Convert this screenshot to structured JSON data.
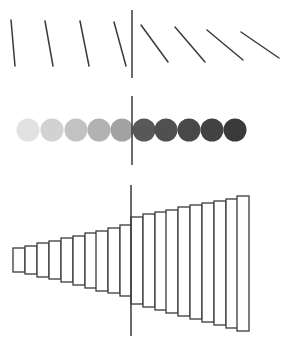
{
  "figure": {
    "width": 286,
    "height": 348,
    "background": "#ffffff",
    "stroke_color": "#3a3a3a",
    "panels": [
      {
        "name": "orientation-lines",
        "divider": {
          "x": 132,
          "y1": 10,
          "y2": 78
        },
        "lines": [
          {
            "x1": 11,
            "y1": 20,
            "x2": 15,
            "y2": 66
          },
          {
            "x1": 45,
            "y1": 21,
            "x2": 53,
            "y2": 66
          },
          {
            "x1": 80,
            "y1": 21,
            "x2": 89,
            "y2": 66
          },
          {
            "x1": 114,
            "y1": 22,
            "x2": 126,
            "y2": 66
          },
          {
            "x1": 141,
            "y1": 25,
            "x2": 168,
            "y2": 62
          },
          {
            "x1": 175,
            "y1": 27,
            "x2": 205,
            "y2": 62
          },
          {
            "x1": 207,
            "y1": 30,
            "x2": 243,
            "y2": 60
          },
          {
            "x1": 241,
            "y1": 32,
            "x2": 279,
            "y2": 58
          }
        ]
      },
      {
        "name": "gray-circles",
        "divider": {
          "x": 132,
          "y1": 96,
          "y2": 165
        },
        "cy": 130,
        "r": 11.5,
        "circles": [
          {
            "cx": 28,
            "fill": "#e2e2e2"
          },
          {
            "cx": 52,
            "fill": "#d2d2d2"
          },
          {
            "cx": 76,
            "fill": "#c2c2c2"
          },
          {
            "cx": 99,
            "fill": "#b2b2b2"
          },
          {
            "cx": 122,
            "fill": "#a2a2a2"
          },
          {
            "cx": 144,
            "fill": "#585858"
          },
          {
            "cx": 166,
            "fill": "#505050"
          },
          {
            "cx": 189,
            "fill": "#484848"
          },
          {
            "cx": 212,
            "fill": "#424242"
          },
          {
            "cx": 235,
            "fill": "#3a3a3a"
          }
        ]
      },
      {
        "name": "size-bars",
        "divider": {
          "x": 131,
          "y1": 185,
          "y2": 336
        },
        "bar_width": 12,
        "bars": [
          {
            "x": 13,
            "top": 248,
            "bottom": 272
          },
          {
            "x": 25,
            "top": 246,
            "bottom": 274
          },
          {
            "x": 37,
            "top": 243,
            "bottom": 277
          },
          {
            "x": 49,
            "top": 241,
            "bottom": 279
          },
          {
            "x": 61,
            "top": 238,
            "bottom": 282
          },
          {
            "x": 73,
            "top": 236,
            "bottom": 285
          },
          {
            "x": 85,
            "top": 233,
            "bottom": 288
          },
          {
            "x": 96,
            "top": 231,
            "bottom": 291
          },
          {
            "x": 108,
            "top": 228,
            "bottom": 293
          },
          {
            "x": 120,
            "top": 225,
            "bottom": 296
          },
          {
            "x": 131,
            "top": 217,
            "bottom": 304
          },
          {
            "x": 143,
            "top": 214,
            "bottom": 307
          },
          {
            "x": 155,
            "top": 212,
            "bottom": 310
          },
          {
            "x": 166,
            "top": 210,
            "bottom": 313
          },
          {
            "x": 178,
            "top": 207,
            "bottom": 316
          },
          {
            "x": 190,
            "top": 205,
            "bottom": 319
          },
          {
            "x": 202,
            "top": 203,
            "bottom": 322
          },
          {
            "x": 214,
            "top": 201,
            "bottom": 325
          },
          {
            "x": 226,
            "top": 199,
            "bottom": 328
          },
          {
            "x": 237,
            "top": 196,
            "bottom": 331
          }
        ]
      }
    ]
  }
}
